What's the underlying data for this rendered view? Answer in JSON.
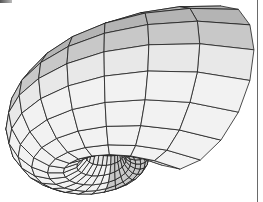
{
  "figure": {
    "colors": {
      "background": "#ffffff",
      "mesh_line": "#1e1e1e",
      "shade_dark": "#b4b4b4",
      "shade_mid": "#c8c8c8",
      "shade_light": "#e8e8e8",
      "shade_lightest": "#f2f2f2",
      "border": "#6a6a6a"
    },
    "mesh": {
      "center": [
        86,
        84
      ],
      "turns": 1.3,
      "theta_steps": 34,
      "phi_steps": 16,
      "growth": 0.36,
      "base_radius": 2.2,
      "tube_ratio": 0.62,
      "tilt": 0.55,
      "rotation_deg": 200
    }
  }
}
